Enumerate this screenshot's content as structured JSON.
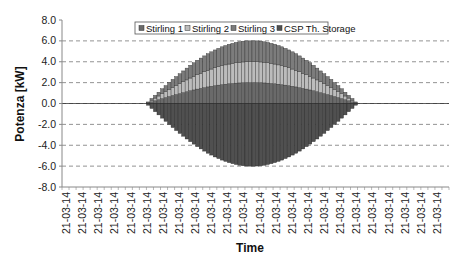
{
  "chart_data": {
    "type": "bar",
    "stacked": true,
    "title": "",
    "xlabel": "Time",
    "ylabel": "Potenza [kW]",
    "ylim": [
      -8.0,
      8.0
    ],
    "yticks": [
      "8.0",
      "6.0",
      "4.0",
      "2.0",
      "0.0",
      "-2.0",
      "-4.0",
      "-6.0",
      "-8.0"
    ],
    "ytick_values": [
      8,
      6,
      4,
      2,
      0,
      -2,
      -4,
      -6,
      -8
    ],
    "grid": "horizontal dashed",
    "legend_position": "top-center inside",
    "xtick_labels": [
      "21-03-14",
      "21-03-14",
      "21-03-14",
      "21-03-14",
      "21-03-14",
      "21-03-14",
      "21-03-14",
      "21-03-14",
      "21-03-14",
      "21-03-14",
      "21-03-14",
      "21-03-14",
      "21-03-14",
      "21-03-14",
      "21-03-14",
      "21-03-14",
      "21-03-14",
      "21-03-14",
      "21-03-14",
      "21-03-14",
      "21-03-14",
      "21-03-14",
      "21-03-14",
      "21-03-14"
    ],
    "n_slots": 110,
    "bar_start_slot": 24,
    "series": [
      {
        "name": "Stirling 1",
        "color": "#6a6a6a",
        "values": [
          0.05,
          0.16,
          0.26,
          0.36,
          0.47,
          0.57,
          0.67,
          0.77,
          0.86,
          0.95,
          1.04,
          1.13,
          1.22,
          1.3,
          1.38,
          1.45,
          1.52,
          1.59,
          1.65,
          1.71,
          1.76,
          1.81,
          1.85,
          1.89,
          1.92,
          1.95,
          1.97,
          1.99,
          2.0,
          2.0,
          2.0,
          2.0,
          1.99,
          1.97,
          1.95,
          1.92,
          1.89,
          1.85,
          1.81,
          1.76,
          1.71,
          1.65,
          1.59,
          1.52,
          1.45,
          1.38,
          1.3,
          1.22,
          1.13,
          1.04,
          0.95,
          0.86,
          0.77,
          0.67,
          0.57,
          0.47,
          0.36,
          0.26,
          0.16,
          0.05
        ]
      },
      {
        "name": "Stirling 2",
        "color": "#bcbcbc",
        "values": [
          0.05,
          0.16,
          0.26,
          0.36,
          0.47,
          0.57,
          0.67,
          0.77,
          0.86,
          0.95,
          1.04,
          1.13,
          1.22,
          1.3,
          1.38,
          1.45,
          1.52,
          1.59,
          1.65,
          1.71,
          1.76,
          1.81,
          1.85,
          1.89,
          1.92,
          1.95,
          1.97,
          1.99,
          2.0,
          2.0,
          2.0,
          2.0,
          1.99,
          1.97,
          1.95,
          1.92,
          1.89,
          1.85,
          1.81,
          1.76,
          1.71,
          1.65,
          1.59,
          1.52,
          1.45,
          1.38,
          1.3,
          1.22,
          1.13,
          1.04,
          0.95,
          0.86,
          0.77,
          0.67,
          0.57,
          0.47,
          0.36,
          0.26,
          0.16,
          0.05
        ]
      },
      {
        "name": "Stirling 3",
        "color": "#7c7c7c",
        "values": [
          0.05,
          0.16,
          0.26,
          0.36,
          0.47,
          0.57,
          0.67,
          0.77,
          0.86,
          0.95,
          1.04,
          1.13,
          1.22,
          1.3,
          1.38,
          1.45,
          1.52,
          1.59,
          1.65,
          1.71,
          1.76,
          1.81,
          1.85,
          1.89,
          1.92,
          1.95,
          1.97,
          1.99,
          2.0,
          2.0,
          2.0,
          2.0,
          1.99,
          1.97,
          1.95,
          1.92,
          1.89,
          1.85,
          1.81,
          1.76,
          1.71,
          1.65,
          1.59,
          1.52,
          1.45,
          1.38,
          1.3,
          1.22,
          1.13,
          1.04,
          0.95,
          0.86,
          0.77,
          0.67,
          0.57,
          0.47,
          0.36,
          0.26,
          0.16,
          0.05
        ]
      },
      {
        "name": "CSP Th. Storage",
        "color": "#505050",
        "values": [
          -0.16,
          -0.47,
          -0.78,
          -1.09,
          -1.4,
          -1.7,
          -2.0,
          -2.3,
          -2.59,
          -2.86,
          -3.13,
          -3.4,
          -3.65,
          -3.89,
          -4.13,
          -4.35,
          -4.56,
          -4.76,
          -4.94,
          -5.12,
          -5.27,
          -5.42,
          -5.54,
          -5.66,
          -5.76,
          -5.84,
          -5.91,
          -5.96,
          -5.99,
          -6.0,
          -6.0,
          -5.99,
          -5.96,
          -5.91,
          -5.84,
          -5.76,
          -5.66,
          -5.54,
          -5.42,
          -5.27,
          -5.12,
          -4.94,
          -4.76,
          -4.56,
          -4.35,
          -4.13,
          -3.89,
          -3.65,
          -3.4,
          -3.13,
          -2.86,
          -2.59,
          -2.3,
          -2.0,
          -1.7,
          -1.4,
          -1.09,
          -0.78,
          -0.47,
          -0.16
        ]
      }
    ]
  },
  "legend": {
    "items": [
      {
        "label": "Stirling 1",
        "color": "#6a6a6a"
      },
      {
        "label": "Stirling 2",
        "color": "#bcbcbc"
      },
      {
        "label": "Stirling 3",
        "color": "#7c7c7c"
      },
      {
        "label": "CSP Th. Storage",
        "color": "#505050"
      }
    ]
  }
}
